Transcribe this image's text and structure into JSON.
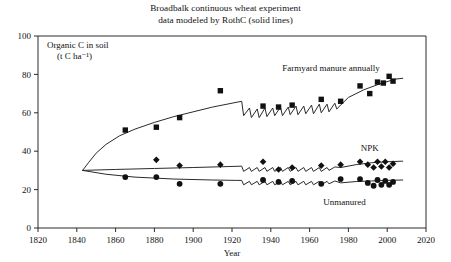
{
  "chart_data": {
    "type": "scatter",
    "title": "Broadbalk continuous wheat experiment",
    "subtitle": "data modeled by RothC (solid lines)",
    "xlabel": "Year",
    "ylabel": "Organic C in soil",
    "ylabel_units": "(t C ha⁻¹)",
    "xlim": [
      1820,
      2020
    ],
    "ylim": [
      0,
      100
    ],
    "xticks": [
      1820,
      1840,
      1860,
      1880,
      1900,
      1920,
      1940,
      1960,
      1980,
      2000,
      2020
    ],
    "yticks": [
      0,
      20,
      40,
      60,
      80,
      100
    ],
    "grid": false,
    "legend_position": "inline-annotations",
    "series": [
      {
        "name": "Farmyard manure annually",
        "label": "Farmyard manure annually",
        "marker": "square",
        "color": "#111111",
        "label_x": 1971,
        "label_y": 82,
        "points": [
          {
            "x": 1865,
            "y": 51.0
          },
          {
            "x": 1881,
            "y": 52.5
          },
          {
            "x": 1893,
            "y": 57.5
          },
          {
            "x": 1914,
            "y": 71.5
          },
          {
            "x": 1936,
            "y": 63.5
          },
          {
            "x": 1944,
            "y": 63.0
          },
          {
            "x": 1951,
            "y": 64.0
          },
          {
            "x": 1966,
            "y": 67.0
          },
          {
            "x": 1976,
            "y": 66.0
          },
          {
            "x": 1986,
            "y": 74.0
          },
          {
            "x": 1991,
            "y": 70.0
          },
          {
            "x": 1995,
            "y": 76.0
          },
          {
            "x": 1998,
            "y": 75.5
          },
          {
            "x": 2001,
            "y": 79.0
          },
          {
            "x": 2003,
            "y": 76.5
          }
        ],
        "model_line": [
          {
            "x": 1843,
            "y": 30.0
          },
          {
            "x": 1846,
            "y": 34.0
          },
          {
            "x": 1850,
            "y": 39.0
          },
          {
            "x": 1855,
            "y": 43.5
          },
          {
            "x": 1862,
            "y": 48.0
          },
          {
            "x": 1870,
            "y": 51.5
          },
          {
            "x": 1880,
            "y": 55.0
          },
          {
            "x": 1890,
            "y": 58.0
          },
          {
            "x": 1900,
            "y": 60.5
          },
          {
            "x": 1910,
            "y": 63.0
          },
          {
            "x": 1920,
            "y": 65.0
          },
          {
            "x": 1925,
            "y": 66.0
          },
          {
            "x": 1926,
            "y": 58.5
          },
          {
            "x": 1929,
            "y": 62.5
          },
          {
            "x": 1930,
            "y": 57.5
          },
          {
            "x": 1933,
            "y": 62.0
          },
          {
            "x": 1934,
            "y": 57.5
          },
          {
            "x": 1937,
            "y": 62.5
          },
          {
            "x": 1938,
            "y": 58.0
          },
          {
            "x": 1941,
            "y": 62.5
          },
          {
            "x": 1942,
            "y": 58.5
          },
          {
            "x": 1945,
            "y": 63.0
          },
          {
            "x": 1946,
            "y": 58.5
          },
          {
            "x": 1949,
            "y": 63.0
          },
          {
            "x": 1950,
            "y": 59.0
          },
          {
            "x": 1953,
            "y": 63.5
          },
          {
            "x": 1954,
            "y": 59.0
          },
          {
            "x": 1957,
            "y": 63.5
          },
          {
            "x": 1958,
            "y": 59.5
          },
          {
            "x": 1961,
            "y": 64.0
          },
          {
            "x": 1962,
            "y": 59.5
          },
          {
            "x": 1965,
            "y": 64.5
          },
          {
            "x": 1966,
            "y": 60.0
          },
          {
            "x": 1969,
            "y": 64.5
          },
          {
            "x": 1970,
            "y": 60.5
          },
          {
            "x": 1973,
            "y": 65.0
          },
          {
            "x": 1974,
            "y": 62.0
          },
          {
            "x": 1980,
            "y": 68.0
          },
          {
            "x": 1988,
            "y": 72.0
          },
          {
            "x": 1996,
            "y": 75.0
          },
          {
            "x": 2004,
            "y": 77.5
          },
          {
            "x": 2008,
            "y": 78.0
          }
        ]
      },
      {
        "name": "NPK",
        "label": "NPK",
        "marker": "diamond",
        "color": "#111111",
        "label_x": 1991,
        "label_y": 40,
        "points": [
          {
            "x": 1881,
            "y": 35.5
          },
          {
            "x": 1893,
            "y": 32.5
          },
          {
            "x": 1914,
            "y": 33.0
          },
          {
            "x": 1936,
            "y": 34.5
          },
          {
            "x": 1944,
            "y": 30.5
          },
          {
            "x": 1951,
            "y": 31.5
          },
          {
            "x": 1966,
            "y": 32.5
          },
          {
            "x": 1976,
            "y": 33.0
          },
          {
            "x": 1986,
            "y": 34.5
          },
          {
            "x": 1990,
            "y": 33.0
          },
          {
            "x": 1993,
            "y": 31.5
          },
          {
            "x": 1995,
            "y": 34.5
          },
          {
            "x": 1997,
            "y": 32.0
          },
          {
            "x": 1999,
            "y": 34.5
          },
          {
            "x": 2001,
            "y": 31.5
          },
          {
            "x": 2003,
            "y": 33.5
          }
        ],
        "model_line": [
          {
            "x": 1843,
            "y": 30.0
          },
          {
            "x": 1860,
            "y": 30.5
          },
          {
            "x": 1880,
            "y": 31.0
          },
          {
            "x": 1900,
            "y": 31.5
          },
          {
            "x": 1918,
            "y": 32.0
          },
          {
            "x": 1925,
            "y": 32.2
          },
          {
            "x": 1926,
            "y": 29.5
          },
          {
            "x": 1929,
            "y": 31.5
          },
          {
            "x": 1930,
            "y": 29.5
          },
          {
            "x": 1933,
            "y": 31.5
          },
          {
            "x": 1934,
            "y": 29.5
          },
          {
            "x": 1937,
            "y": 31.5
          },
          {
            "x": 1938,
            "y": 29.5
          },
          {
            "x": 1941,
            "y": 31.5
          },
          {
            "x": 1942,
            "y": 29.5
          },
          {
            "x": 1945,
            "y": 31.5
          },
          {
            "x": 1946,
            "y": 29.5
          },
          {
            "x": 1949,
            "y": 31.5
          },
          {
            "x": 1950,
            "y": 29.5
          },
          {
            "x": 1953,
            "y": 31.5
          },
          {
            "x": 1954,
            "y": 29.5
          },
          {
            "x": 1957,
            "y": 31.5
          },
          {
            "x": 1958,
            "y": 29.5
          },
          {
            "x": 1961,
            "y": 31.5
          },
          {
            "x": 1962,
            "y": 29.5
          },
          {
            "x": 1965,
            "y": 31.5
          },
          {
            "x": 1966,
            "y": 29.5
          },
          {
            "x": 1969,
            "y": 31.5
          },
          {
            "x": 1970,
            "y": 30.0
          },
          {
            "x": 1973,
            "y": 31.8
          },
          {
            "x": 1976,
            "y": 31.5
          },
          {
            "x": 1984,
            "y": 33.0
          },
          {
            "x": 1992,
            "y": 34.0
          },
          {
            "x": 2000,
            "y": 34.5
          },
          {
            "x": 2008,
            "y": 34.8
          }
        ]
      },
      {
        "name": "Unmanured",
        "label": "Unmanured",
        "marker": "circle",
        "color": "#111111",
        "label_x": 1978,
        "label_y": 12,
        "points": [
          {
            "x": 1865,
            "y": 26.5
          },
          {
            "x": 1881,
            "y": 26.5
          },
          {
            "x": 1893,
            "y": 23.0
          },
          {
            "x": 1914,
            "y": 23.0
          },
          {
            "x": 1936,
            "y": 25.0
          },
          {
            "x": 1944,
            "y": 24.0
          },
          {
            "x": 1951,
            "y": 24.5
          },
          {
            "x": 1966,
            "y": 23.0
          },
          {
            "x": 1976,
            "y": 25.5
          },
          {
            "x": 1986,
            "y": 25.5
          },
          {
            "x": 1990,
            "y": 23.5
          },
          {
            "x": 1993,
            "y": 22.0
          },
          {
            "x": 1995,
            "y": 25.0
          },
          {
            "x": 1997,
            "y": 22.5
          },
          {
            "x": 1999,
            "y": 24.5
          },
          {
            "x": 2001,
            "y": 22.5
          },
          {
            "x": 2003,
            "y": 24.0
          }
        ],
        "model_line": [
          {
            "x": 1843,
            "y": 30.0
          },
          {
            "x": 1855,
            "y": 28.0
          },
          {
            "x": 1870,
            "y": 26.5
          },
          {
            "x": 1890,
            "y": 25.5
          },
          {
            "x": 1910,
            "y": 25.0
          },
          {
            "x": 1922,
            "y": 24.8
          },
          {
            "x": 1925,
            "y": 24.8
          },
          {
            "x": 1926,
            "y": 22.5
          },
          {
            "x": 1929,
            "y": 24.3
          },
          {
            "x": 1930,
            "y": 22.5
          },
          {
            "x": 1933,
            "y": 24.3
          },
          {
            "x": 1934,
            "y": 22.5
          },
          {
            "x": 1937,
            "y": 24.3
          },
          {
            "x": 1938,
            "y": 22.5
          },
          {
            "x": 1941,
            "y": 24.3
          },
          {
            "x": 1942,
            "y": 22.5
          },
          {
            "x": 1945,
            "y": 24.3
          },
          {
            "x": 1946,
            "y": 22.5
          },
          {
            "x": 1949,
            "y": 24.3
          },
          {
            "x": 1950,
            "y": 22.5
          },
          {
            "x": 1953,
            "y": 24.3
          },
          {
            "x": 1954,
            "y": 22.5
          },
          {
            "x": 1957,
            "y": 24.3
          },
          {
            "x": 1958,
            "y": 22.5
          },
          {
            "x": 1961,
            "y": 24.3
          },
          {
            "x": 1962,
            "y": 22.5
          },
          {
            "x": 1965,
            "y": 24.3
          },
          {
            "x": 1966,
            "y": 22.5
          },
          {
            "x": 1969,
            "y": 24.3
          },
          {
            "x": 1970,
            "y": 23.0
          },
          {
            "x": 1973,
            "y": 24.5
          },
          {
            "x": 1976,
            "y": 23.5
          },
          {
            "x": 1984,
            "y": 24.2
          },
          {
            "x": 1992,
            "y": 24.5
          },
          {
            "x": 2000,
            "y": 24.8
          },
          {
            "x": 2008,
            "y": 25.0
          }
        ]
      }
    ]
  }
}
